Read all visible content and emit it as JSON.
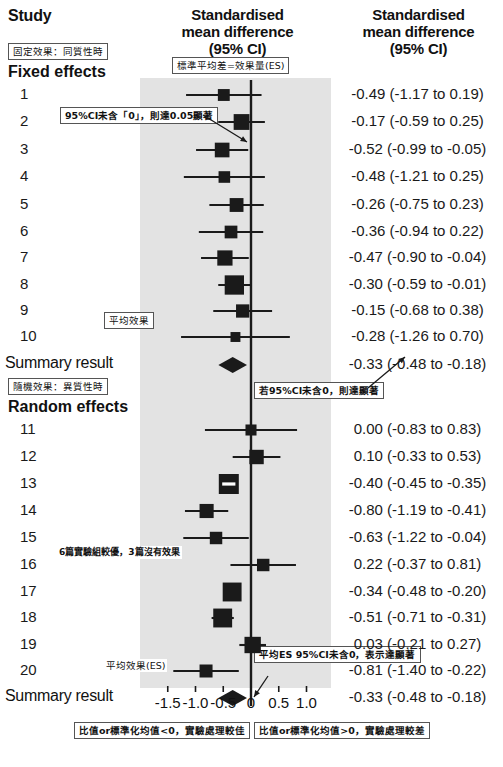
{
  "header": {
    "study_col": "Study",
    "middle_col": "Standardised\nmean difference\n(95% CI)",
    "middle_col_line1": "Standardised",
    "middle_col_line2": "mean difference",
    "middle_col_line3": "(95% CI)",
    "right_col_line1": "Standardised",
    "right_col_line2": "mean difference",
    "right_col_line3": "(95% CI)"
  },
  "sections": {
    "fixed_title": "Fixed effects",
    "fixed_note": "固定效果：同質性時",
    "random_title": "Random effects",
    "random_note": "隨機效果：異質性時",
    "summary_label": "Summary result"
  },
  "annotations": {
    "es_definition": "標準平均差=效果量(ES)",
    "ci_not_contain_zero": "95%CI未含「0」，則達0.05顯著",
    "ci_zero_significant": "若95%CI未含0，則達顯著",
    "mean_effect": "平均效果",
    "mean_effect_es": "平均效果(ES)",
    "pooled_es_note": "平均ES 95%CI未含0，表示達顯著",
    "row17_note": "6篇實驗組較優，3篇沒有效果",
    "footer_left": "比值or標準化均值<0，實驗處理較佳",
    "footer_right": "比值or標準化均值>0，實驗處理較差"
  },
  "chart_data": {
    "type": "forest",
    "title": "Standardised mean difference (95% CI)",
    "xlabel": "",
    "ylabel": "Study",
    "xlim": [
      -1.75,
      1.25
    ],
    "null_line": 0,
    "grid": false,
    "axis_ticks": [
      -1.5,
      -1.0,
      -0.5,
      0,
      0.5,
      1.0
    ],
    "axis_tick_labels": [
      "-1.5",
      "-1.0",
      "-0.5",
      "0",
      "0.5",
      "1.0"
    ],
    "colors": {
      "marker": "#1a1a1a",
      "band": "#e3e3e3",
      "line": "#1a1a1a",
      "text": "#111111"
    },
    "groups": [
      {
        "name": "Fixed effects",
        "studies": [
          {
            "label": "1",
            "estimate": -0.49,
            "lower": -1.17,
            "upper": 0.19,
            "weight": 0.42,
            "text": "-0.49 (-1.17 to 0.19)"
          },
          {
            "label": "2",
            "estimate": -0.17,
            "lower": -0.59,
            "upper": 0.25,
            "weight": 0.7,
            "text": "-0.17 (-0.59 to 0.25)"
          },
          {
            "label": "3",
            "estimate": -0.52,
            "lower": -0.99,
            "upper": -0.05,
            "weight": 0.62,
            "text": "-0.52 (-0.99 to -0.05)"
          },
          {
            "label": "4",
            "estimate": -0.48,
            "lower": -1.21,
            "upper": 0.25,
            "weight": 0.4,
            "text": "-0.48 (-1.21 to 0.25)"
          },
          {
            "label": "5",
            "estimate": -0.26,
            "lower": -0.75,
            "upper": 0.23,
            "weight": 0.56,
            "text": "-0.26 (-0.75 to 0.23)"
          },
          {
            "label": "6",
            "estimate": -0.36,
            "lower": -0.94,
            "upper": 0.22,
            "weight": 0.48,
            "text": "-0.36 (-0.94 to 0.22)"
          },
          {
            "label": "7",
            "estimate": -0.47,
            "lower": -0.9,
            "upper": -0.04,
            "weight": 0.66,
            "text": "-0.47 (-0.90 to -0.04)"
          },
          {
            "label": "8",
            "estimate": -0.3,
            "lower": -0.59,
            "upper": -0.01,
            "weight": 0.95,
            "text": "-0.30 (-0.59 to -0.01)"
          },
          {
            "label": "9",
            "estimate": -0.15,
            "lower": -0.68,
            "upper": 0.38,
            "weight": 0.52,
            "text": "-0.15 (-0.68 to 0.38)"
          },
          {
            "label": "10",
            "estimate": -0.28,
            "lower": -1.26,
            "upper": 0.7,
            "weight": 0.28,
            "text": "-0.28 (-1.26 to 0.70)"
          }
        ],
        "summary": {
          "label": "Summary result",
          "estimate": -0.33,
          "lower": -0.48,
          "upper": -0.18,
          "text": "-0.33 (-0.48 to -0.18)"
        }
      },
      {
        "name": "Random effects",
        "studies": [
          {
            "label": "11",
            "estimate": 0.0,
            "lower": -0.83,
            "upper": 0.83,
            "weight": 0.36,
            "text": "0.00 (-0.83 to 0.83)"
          },
          {
            "label": "12",
            "estimate": 0.1,
            "lower": -0.33,
            "upper": 0.53,
            "weight": 0.6,
            "text": "0.10 (-0.33 to 0.53)"
          },
          {
            "label": "13",
            "estimate": -0.4,
            "lower": -0.45,
            "upper": -0.35,
            "weight": 1.0,
            "text": "-0.40 (-0.45 to -0.35)"
          },
          {
            "label": "14",
            "estimate": -0.8,
            "lower": -1.19,
            "upper": -0.41,
            "weight": 0.58,
            "text": "-0.80 (-1.19 to -0.41)"
          },
          {
            "label": "15",
            "estimate": -0.63,
            "lower": -1.22,
            "upper": -0.04,
            "weight": 0.46,
            "text": "-0.63 (-1.22 to -0.04)"
          },
          {
            "label": "16",
            "estimate": 0.22,
            "lower": -0.37,
            "upper": 0.81,
            "weight": 0.46,
            "text": "0.22 (-0.37 to 0.81)"
          },
          {
            "label": "17",
            "estimate": -0.34,
            "lower": -0.48,
            "upper": -0.2,
            "weight": 0.92,
            "text": "-0.34 (-0.48 to -0.20)"
          },
          {
            "label": "18",
            "estimate": -0.51,
            "lower": -0.71,
            "upper": -0.31,
            "weight": 0.92,
            "text": "-0.51 (-0.71 to -0.31)"
          },
          {
            "label": "19",
            "estimate": 0.03,
            "lower": -0.21,
            "upper": 0.27,
            "weight": 0.74,
            "text": "0.03 (-0.21 to 0.27)"
          },
          {
            "label": "20",
            "estimate": -0.81,
            "lower": -1.4,
            "upper": -0.22,
            "weight": 0.5,
            "text": "-0.81 (-1.40 to -0.22)"
          }
        ],
        "summary": {
          "label": "Summary result",
          "estimate": -0.33,
          "lower": -0.48,
          "upper": -0.18,
          "text": "-0.33 (-0.48 to -0.18)"
        }
      }
    ]
  }
}
